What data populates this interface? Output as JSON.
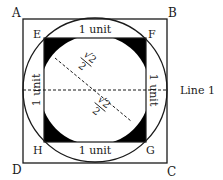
{
  "diagram": {
    "vertices": {
      "A": "A",
      "B": "B",
      "C": "C",
      "D": "D",
      "E": "E",
      "F": "F",
      "G": "G",
      "H": "H"
    },
    "side_labels": {
      "top": "1 unit",
      "bottom": "1 unit",
      "left": "1 unit",
      "right": "1 unit"
    },
    "diagonal_labels": {
      "upper": {
        "numerator": "√2",
        "denominator": "2"
      },
      "lower": {
        "numerator": "√2",
        "denominator": "2"
      }
    },
    "line_label": "Line 1",
    "colors": {
      "stroke": "#1a1a1a",
      "fill_shaded": "#000000",
      "background": "#ffffff"
    }
  }
}
